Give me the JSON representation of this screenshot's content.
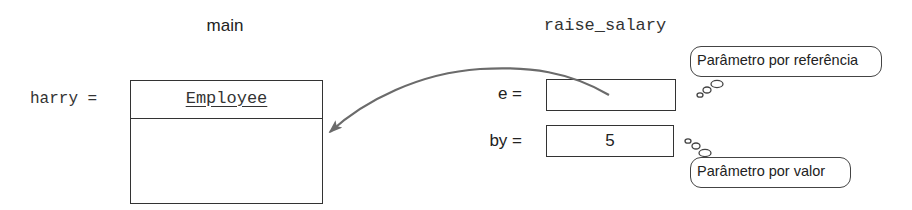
{
  "frames": {
    "caller": {
      "title": "main",
      "variable_label": "harry =",
      "object": {
        "class_name": "Employee"
      }
    },
    "callee": {
      "title": "raise_salary",
      "params": [
        {
          "label": "e =",
          "value": ""
        },
        {
          "label": "by =",
          "value": "5"
        }
      ]
    }
  },
  "annotations": {
    "by_reference": "Parâmetro por referência",
    "by_value": "Parâmetro por valor"
  },
  "colors": {
    "stroke": "#333333",
    "arrow": "#6b6b6b",
    "text": "#222222"
  }
}
